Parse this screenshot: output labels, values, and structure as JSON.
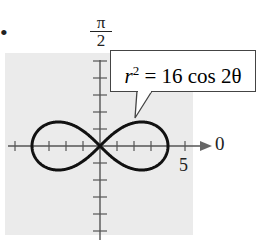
{
  "figure": {
    "bullet": "•",
    "angle_label_top": {
      "num": "π",
      "den": "2"
    },
    "angle_label_right": "0",
    "tick_label": "5",
    "equation": {
      "lhs": "r",
      "exp": "2",
      "rhs": " = 16 cos 2θ"
    }
  },
  "colors": {
    "background_panel": "#ebebeb",
    "curve": "#111111",
    "axis": "#555555"
  },
  "chart_data": {
    "type": "polar-curve",
    "title": "",
    "equation": "r^2 = 16 cos 2θ",
    "curve": "lemniscate",
    "max_r": 4,
    "axis_labels": {
      "polar_axis": "0",
      "vertical": "π/2"
    },
    "tick_labels": [
      {
        "value": 5,
        "label": "5"
      }
    ],
    "tick_spacing": 1,
    "xlim": [
      -5,
      5
    ],
    "ylim": [
      -5,
      5
    ]
  }
}
